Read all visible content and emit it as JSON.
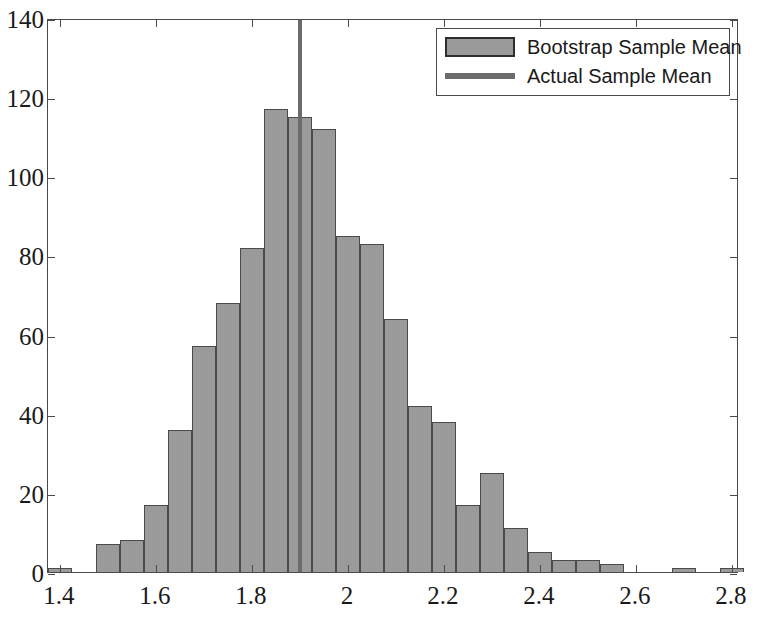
{
  "chart_data": {
    "type": "bar",
    "title": "",
    "subtitle": "",
    "xlabel": "",
    "ylabel": "",
    "xlim": [
      1.375,
      2.815
    ],
    "ylim": [
      0,
      140
    ],
    "grid": false,
    "legend_position": "top-right",
    "bin_width": 0.05,
    "x_ticks": [
      "1.4",
      "1.6",
      "1.8",
      "2",
      "2.2",
      "2.4",
      "2.6",
      "2.8"
    ],
    "x_tick_values": [
      1.4,
      1.6,
      1.8,
      2.0,
      2.2,
      2.4,
      2.6,
      2.8
    ],
    "y_ticks": [
      "0",
      "20",
      "40",
      "60",
      "80",
      "100",
      "120",
      "140"
    ],
    "y_tick_values": [
      0,
      20,
      40,
      60,
      80,
      100,
      120,
      140
    ],
    "bin_centers": [
      1.4,
      1.45,
      1.5,
      1.55,
      1.6,
      1.65,
      1.7,
      1.75,
      1.8,
      1.85,
      1.9,
      1.95,
      2.0,
      2.05,
      2.1,
      2.15,
      2.2,
      2.25,
      2.3,
      2.35,
      2.4,
      2.45,
      2.5,
      2.55,
      2.6,
      2.65,
      2.7,
      2.75,
      2.8
    ],
    "values": [
      1,
      0,
      7,
      8,
      17,
      36,
      57,
      68,
      82,
      117,
      115,
      112,
      85,
      83,
      64,
      42,
      38,
      17,
      25,
      11,
      5,
      3,
      3,
      2,
      0,
      0,
      1,
      0,
      1
    ],
    "series": [
      {
        "name": "Bootstrap Sample Mean",
        "type": "histogram",
        "values": [
          1,
          0,
          7,
          8,
          17,
          36,
          57,
          68,
          82,
          117,
          115,
          112,
          85,
          83,
          64,
          42,
          38,
          17,
          25,
          11,
          5,
          3,
          3,
          2,
          0,
          0,
          1,
          0,
          1
        ]
      },
      {
        "name": "Actual Sample Mean",
        "type": "vline",
        "value": 1.9
      }
    ],
    "annotations": [
      {
        "name": "actual-sample-mean-line",
        "x": 1.9,
        "label": "Actual Sample Mean"
      }
    ]
  },
  "legend": {
    "items": [
      {
        "label": "Bootstrap Sample Mean",
        "marker": "filled-box",
        "color": "#9a9a9a"
      },
      {
        "label": "Actual Sample Mean",
        "marker": "line",
        "color": "#6b6b6b"
      }
    ]
  },
  "colors": {
    "bar_fill": "#9a9a9a",
    "bar_edge": "#4a4a4a",
    "mean_line": "#6b6b6b",
    "axis": "#4a4a4a",
    "background": "#ffffff",
    "text": "#1a1a1a"
  }
}
